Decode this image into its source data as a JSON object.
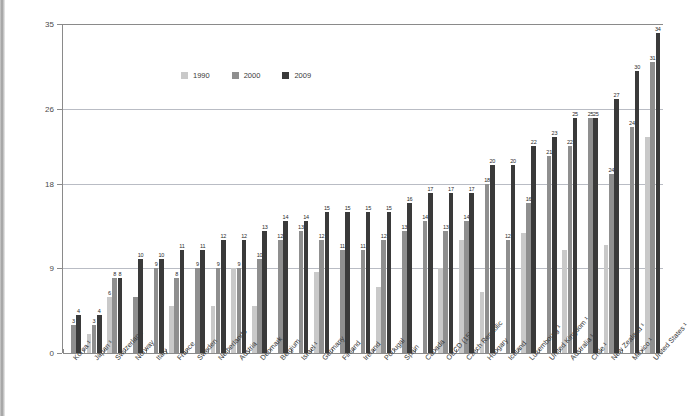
{
  "chart_data": {
    "type": "bar",
    "title": "",
    "xlabel": "",
    "ylabel": "",
    "ylim": [
      0,
      35
    ],
    "yticks": [
      0,
      9,
      18,
      26,
      35
    ],
    "grid": true,
    "legend_position": "top-left",
    "categories": [
      "Korea ¹",
      "Japan ¹",
      "Switzerland",
      "Norway",
      "Italy",
      "France",
      "Sweden",
      "Netherlands",
      "Austria",
      "Denmark",
      "Belgium",
      "Israel ¹",
      "Germany",
      "Finland",
      "Ireland",
      "Portugal",
      "Spain",
      "Canada",
      "OECD (15)",
      "Czech Republic",
      "Hungary",
      "Iceland",
      "Luxembourg ¹",
      "United Kingdom ¹",
      "Australia ¹",
      "Chile ¹",
      "New Zealand ¹",
      "Mexico ¹",
      "United States ¹"
    ],
    "series": [
      {
        "name": "1990",
        "color": "#c9c9c9",
        "values": [
          null,
          2,
          6,
          null,
          null,
          5,
          null,
          5,
          9,
          5,
          null,
          null,
          8.6,
          null,
          null,
          7,
          null,
          null,
          9,
          12,
          6.5,
          null,
          12.8,
          null,
          11,
          null,
          11.5,
          null,
          23
        ]
      },
      {
        "name": "2000",
        "color": "#8f8f8f",
        "values": [
          3,
          3,
          8,
          6,
          9,
          8,
          9,
          9,
          9,
          10,
          12,
          13,
          12,
          11,
          11,
          12,
          13,
          14,
          13,
          14,
          18,
          12,
          16,
          21,
          22,
          25,
          19,
          24,
          31
        ]
      },
      {
        "name": "2009",
        "color": "#3a3a3a",
        "values": [
          4,
          4,
          8,
          10,
          10,
          11,
          11,
          12,
          12,
          13,
          14,
          14,
          15,
          15,
          15,
          15,
          16,
          17,
          17,
          17,
          20,
          20,
          22,
          23,
          25,
          25,
          27,
          30,
          34
        ]
      }
    ],
    "value_labels": {
      "1990": [
        null,
        null,
        "6",
        null,
        null,
        null,
        null,
        null,
        null,
        null,
        null,
        null,
        null,
        null,
        null,
        null,
        null,
        null,
        null,
        null,
        null,
        null,
        null,
        null,
        null,
        null,
        null,
        null,
        null
      ],
      "2000": [
        "3",
        "3",
        "8",
        null,
        "9",
        "8",
        "9",
        "9",
        "9",
        "10",
        "12",
        "13",
        "12",
        "11",
        "11",
        "12",
        "13",
        "14",
        "13",
        "14",
        "18",
        "12",
        "16",
        "21",
        "22",
        "25",
        "24",
        "24",
        "31"
      ],
      "2009": [
        "4",
        "4",
        "8",
        "10",
        "10",
        "11",
        "11",
        "12",
        "12",
        "13",
        "14",
        "14",
        "15",
        "15",
        "15",
        "15",
        "16",
        "17",
        "17",
        "17",
        "20",
        "20",
        "22",
        "23",
        "25",
        "25",
        "27",
        "30",
        "34"
      ]
    }
  },
  "legend": {
    "items": [
      {
        "label": "1990",
        "color": "#c9c9c9"
      },
      {
        "label": "2000",
        "color": "#8f8f8f"
      },
      {
        "label": "2009",
        "color": "#3a3a3a"
      }
    ]
  }
}
